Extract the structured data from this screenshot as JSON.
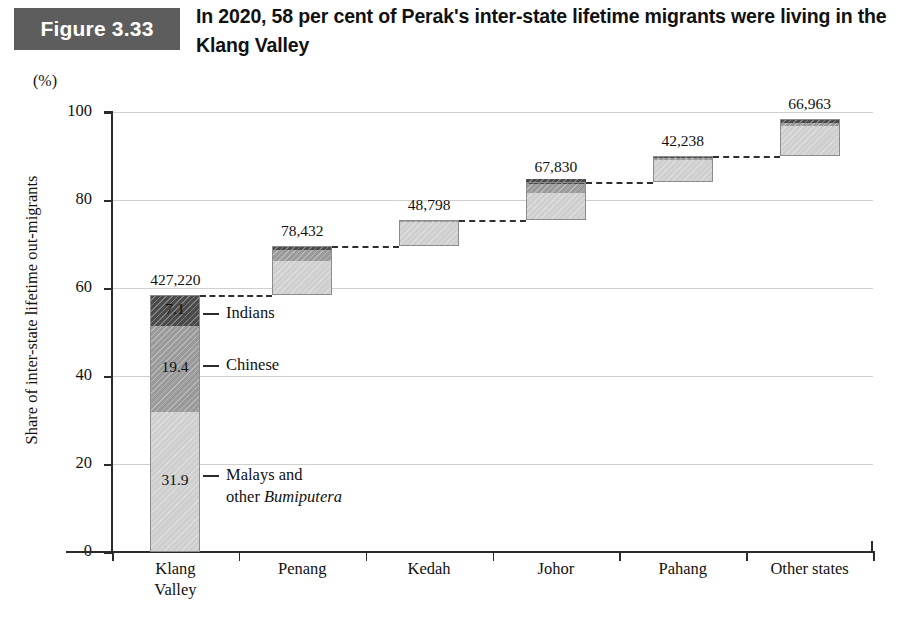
{
  "figure": {
    "badge_label": "Figure 3.33",
    "title": "In 2020, 58 per cent of Perak's inter-state lifetime migrants were living in the Klang Valley",
    "badge_color": "#5d5d5d"
  },
  "axes": {
    "unit_label": "(%)",
    "y_axis_title": "Share of inter-state lifetime out-migrants",
    "y_ticks": [
      "0",
      "20",
      "40",
      "60",
      "80",
      "100"
    ],
    "x_tick_labels": [
      [
        "Klang",
        "Valley"
      ],
      [
        "Penang"
      ],
      [
        "Kedah"
      ],
      [
        "Johor"
      ],
      [
        "Pahang"
      ],
      [
        "Other states"
      ]
    ]
  },
  "callouts": [
    {
      "name": "indians",
      "label": "Indians"
    },
    {
      "name": "chinese",
      "label": "Chinese"
    },
    {
      "name": "malays",
      "label_line1": "Malays and",
      "label_line2_prefix": "other ",
      "label_line2_italic": "Bumiputera"
    }
  ],
  "colors": {
    "malays": "#cfcfcf",
    "chinese": "#9a9a9a",
    "indians": "#4a4a4a",
    "gridline": "#cfcfcf",
    "axis": "#2b2b2b"
  },
  "chart_data": {
    "type": "bar",
    "variant": "stacked-waterfall",
    "title": "In 2020, 58 per cent of Perak's inter-state lifetime migrants were living in the Klang Valley",
    "xlabel": "",
    "ylabel": "Share of inter-state lifetime out-migrants",
    "yunit": "(%)",
    "ylim": [
      0,
      100
    ],
    "yticks": [
      0,
      20,
      40,
      60,
      80,
      100
    ],
    "grid": true,
    "legend_position": "callout-annotations",
    "categories": [
      "Klang Valley",
      "Penang",
      "Kedah",
      "Johor",
      "Pahang",
      "Other states"
    ],
    "series": [
      {
        "name": "Malays and other Bumiputera",
        "color": "#cfcfcf",
        "values": [
          31.9,
          7.8,
          5.4,
          6.0,
          5.0,
          7.0
        ]
      },
      {
        "name": "Chinese",
        "color": "#9a9a9a",
        "values": [
          19.4,
          2.5,
          0.3,
          2.2,
          0.4,
          0.6
        ]
      },
      {
        "name": "Indians",
        "color": "#4a4a4a",
        "values": [
          7.1,
          0.8,
          0.3,
          1.0,
          0.4,
          1.0
        ]
      }
    ],
    "cumulative_base": [
      0.0,
      58.4,
      69.5,
      75.5,
      84.2,
      89.9
    ],
    "cumulative_top": [
      58.4,
      69.5,
      75.5,
      84.2,
      89.9,
      98.5
    ],
    "bar_totals_labels": [
      "427,220",
      "78,432",
      "48,798",
      "67,830",
      "42,238",
      "66,963"
    ],
    "segment_labels": {
      "Klang Valley": {
        "Malays and other Bumiputera": "31.9",
        "Chinese": "19.4",
        "Indians": "7.1"
      }
    },
    "annotations": [
      "Indians",
      "Chinese",
      "Malays and other Bumiputera"
    ],
    "connectors": "dashed lines linking each bar top to the base of the following bar"
  }
}
